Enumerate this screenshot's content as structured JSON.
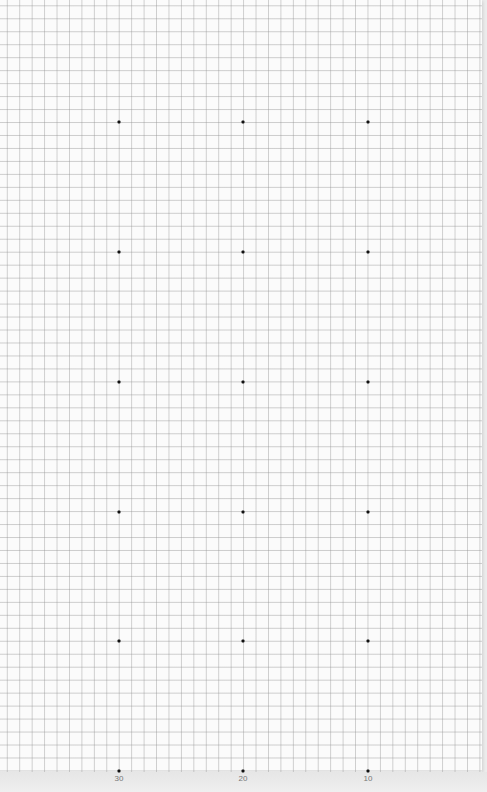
{
  "chart_data": {
    "type": "scatter",
    "title": "",
    "xlabel": "",
    "ylabel": "",
    "grid": true,
    "x_tick_labels": [
      "30",
      "20",
      "10"
    ],
    "x_direction": "decreasing left-to-right",
    "points_per_column": 6,
    "columns": [
      {
        "x": 30,
        "pixel_x": 119
      },
      {
        "x": 20,
        "pixel_x": 243
      },
      {
        "x": 10,
        "pixel_x": 368
      }
    ],
    "rows_pixel_y": [
      122,
      252,
      382,
      512,
      641,
      771
    ],
    "points": [
      {
        "x": 30,
        "row": 0
      },
      {
        "x": 20,
        "row": 0
      },
      {
        "x": 10,
        "row": 0
      },
      {
        "x": 30,
        "row": 1
      },
      {
        "x": 20,
        "row": 1
      },
      {
        "x": 10,
        "row": 1
      },
      {
        "x": 30,
        "row": 2
      },
      {
        "x": 20,
        "row": 2
      },
      {
        "x": 10,
        "row": 2
      },
      {
        "x": 30,
        "row": 3
      },
      {
        "x": 20,
        "row": 3
      },
      {
        "x": 10,
        "row": 3
      },
      {
        "x": 30,
        "row": 4
      },
      {
        "x": 20,
        "row": 4
      },
      {
        "x": 10,
        "row": 4
      },
      {
        "x": 30,
        "row": 5
      },
      {
        "x": 20,
        "row": 5
      },
      {
        "x": 10,
        "row": 5
      }
    ],
    "legend": null
  },
  "axis": {
    "labels": [
      {
        "text": "30",
        "x": 119
      },
      {
        "text": "20",
        "x": 243
      },
      {
        "text": "10",
        "x": 368
      }
    ]
  },
  "colors": {
    "paper": "#fbfbfb",
    "grid": "#b4b4b4",
    "dot": "#111111",
    "label": "#777777",
    "margin": "#ececec"
  }
}
